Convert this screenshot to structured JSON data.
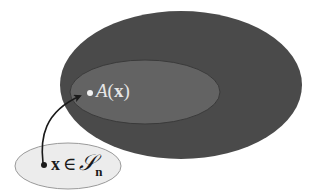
{
  "diagram": {
    "colors": {
      "background": "#ffffff",
      "outer_set_fill": "#4a4a4a",
      "inner_set_fill": "#636363",
      "inner_set_stroke": "#3a3a3a",
      "domain_set_fill": "#ececec",
      "domain_set_stroke": "#9a9a9a",
      "arrow": "#1a1a1a",
      "image_point": "#f2f2f2",
      "domain_point": "#1a1a1a"
    },
    "outer_set": {
      "cx": 181,
      "cy": 85,
      "rx": 121,
      "ry": 74
    },
    "inner_set": {
      "cx": 145,
      "cy": 92,
      "rx": 75,
      "ry": 32
    },
    "domain_set": {
      "cx": 68,
      "cy": 166,
      "rx": 53,
      "ry": 23
    },
    "image_point": {
      "cx": 90,
      "cy": 93,
      "r": 3
    },
    "domain_point": {
      "cx": 44,
      "cy": 165,
      "r": 3
    },
    "image_label": {
      "function": "A",
      "open_paren": "(",
      "argument": "x",
      "close_paren": ")"
    },
    "domain_label": {
      "variable": "x",
      "relation": "∈",
      "set_symbol": "𝒮",
      "subscript": "n"
    }
  }
}
